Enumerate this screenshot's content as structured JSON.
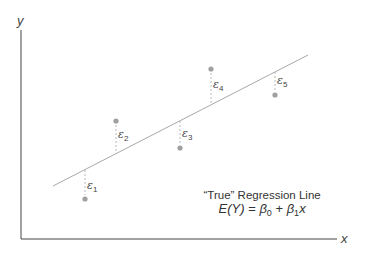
{
  "axes": {
    "x_label": "x",
    "y_label": "y"
  },
  "regression_line": {
    "caption": "“True” Regression Line",
    "equation_parts": {
      "lhs": "E(Y)",
      "eq": " = ",
      "b0": "β",
      "b0_sub": "0",
      "plus": " + ",
      "b1": "β",
      "b1_sub": "1",
      "x": "x"
    }
  },
  "residuals": [
    {
      "symbol": "ε",
      "sub": "1"
    },
    {
      "symbol": "ε",
      "sub": "2"
    },
    {
      "symbol": "ε",
      "sub": "3"
    },
    {
      "symbol": "ε",
      "sub": "4"
    },
    {
      "symbol": "ε",
      "sub": "5"
    }
  ]
}
